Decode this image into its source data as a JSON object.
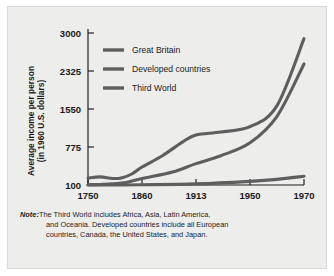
{
  "figure": {
    "background_color": "#ededec",
    "border_color": "#d8d8d6",
    "line_color": "#5e5e5e",
    "text_color": "#1a1a1a"
  },
  "note": {
    "label": "Note:",
    "line1": "The Third World includes Africa, Asia, Latin America,",
    "line2": "and Oceania. Developed countries include all European",
    "line3": "countries, Canada, the United States, and Japan."
  },
  "chart_data": {
    "type": "line",
    "title": "",
    "xlabel": "",
    "ylabel": "Average income per person (in 1960 U.S. dollars)",
    "ylabel_line1": "Average income per person",
    "ylabel_line2": "(in 1960 U.S. dollars)",
    "grid": false,
    "legend_position": "top-left-inside",
    "x_tick_labels": [
      "1750",
      "1860",
      "1913",
      "1950",
      "1970"
    ],
    "x_tick_values": [
      1750,
      1860,
      1913,
      1950,
      1970
    ],
    "y_tick_labels": [
      "100",
      "775",
      "1550",
      "2325",
      "3000"
    ],
    "y_tick_values": [
      100,
      775,
      1550,
      2325,
      3000
    ],
    "ylim": [
      100,
      3000
    ],
    "xlim": [
      1750,
      1970
    ],
    "series": [
      {
        "name": "Great Britain",
        "x": [
          1750,
          1775,
          1800,
          1820,
          1840,
          1860,
          1880,
          1900,
          1913,
          1930,
          1950,
          1960,
          1970
        ],
        "values": [
          225,
          245,
          215,
          230,
          300,
          420,
          620,
          880,
          1020,
          1080,
          1190,
          1620,
          2900
        ]
      },
      {
        "name": "Developed countries",
        "x": [
          1750,
          1775,
          1800,
          1830,
          1860,
          1890,
          1913,
          1930,
          1950,
          1960,
          1970
        ],
        "values": [
          105,
          110,
          120,
          150,
          215,
          330,
          480,
          620,
          860,
          1400,
          2450
        ]
      },
      {
        "name": "Third World",
        "x": [
          1750,
          1800,
          1860,
          1913,
          1950,
          1960,
          1970
        ],
        "values": [
          100,
          100,
          105,
          120,
          165,
          200,
          255
        ]
      }
    ]
  }
}
